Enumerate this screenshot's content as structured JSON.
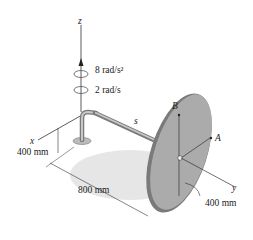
{
  "labels": {
    "z_axis": "z",
    "x_axis": "x",
    "y_axis": "y",
    "angular_acceleration": "8 rad/s²",
    "angular_velocity": "2 rad/s",
    "rod": "s",
    "point_b": "B",
    "point_a": "A",
    "height_dim": "400 mm",
    "length_dim": "800 mm",
    "radius_dim": "400 mm"
  },
  "colors": {
    "disk_fill": "#a9a9a9",
    "disk_rim": "#6e6e6e",
    "shadow": "#e3e3e3",
    "rod": "#8c8c8c",
    "line": "#333333"
  }
}
